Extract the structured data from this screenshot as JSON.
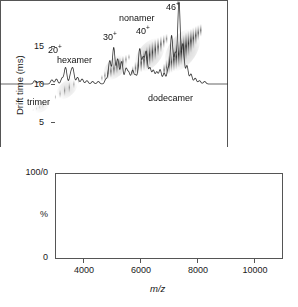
{
  "figure": {
    "panels": [
      {
        "id": "mobility",
        "role": "ion-mobility-2d-plot"
      },
      {
        "id": "spectrum",
        "role": "mass-spectrum"
      }
    ]
  },
  "top_panel": {
    "ylabel": "Drift time (ms)",
    "yticks": [
      "5",
      "10",
      "15"
    ]
  },
  "bottom_panel": {
    "ylabel": "%",
    "ytick_top": "100/0",
    "ytick_bottom": "0",
    "xlabel": "m/z",
    "xticks": [
      "4000",
      "6000",
      "8000",
      "10000"
    ]
  },
  "annotations": {
    "oligomers": [
      {
        "name": "trimer",
        "label": "trimer"
      },
      {
        "name": "hexamer",
        "label": "hexamer"
      },
      {
        "name": "nonamer",
        "label": "nonamer"
      },
      {
        "name": "dodecamer",
        "label": "dodecamer"
      }
    ],
    "charge_states": [
      {
        "name": "charge-20",
        "base": "20",
        "sup": "+"
      },
      {
        "name": "charge-30",
        "base": "30",
        "sup": "+"
      },
      {
        "name": "charge-40",
        "base": "40",
        "sup": "+"
      },
      {
        "name": "charge-46",
        "base": "46",
        "sup": "+"
      }
    ]
  },
  "colors": {
    "axis": "#555555",
    "text": "#111111",
    "trace": "#333333",
    "blob": "#808080"
  },
  "chart_data": [
    {
      "type": "scatter",
      "id": "ion-mobility-2d",
      "title": "",
      "xlabel": "m/z",
      "ylabel": "Drift time (ms)",
      "xlim": [
        3000,
        11000
      ],
      "ylim": [
        0,
        18.5
      ],
      "grid": false,
      "legend": "none",
      "yticks": [
        5,
        10,
        15
      ],
      "note": "Greyscale intensity map; each oligomer appears as a tilted elliptical cloud of vertically striated charge-state spots running diagonally from low m/z / low drift time to high m/z / high drift time.",
      "features": [
        {
          "label": "trimer",
          "oligomer_order": 3,
          "mz_center": 4450,
          "mz_span": [
            4150,
            4750
          ],
          "drift_center": 5.1,
          "drift_span": [
            4.6,
            5.6
          ],
          "intensity": 0.18,
          "label_pos": {
            "mz": 4900,
            "drift": 6.6
          }
        },
        {
          "label": "trimer-cluster-2",
          "oligomer_order": 3,
          "mz_center": 5350,
          "mz_span": [
            4950,
            5800
          ],
          "drift_center": 7.3,
          "drift_span": [
            6.2,
            8.5
          ],
          "intensity": 0.55,
          "label_pos": null
        },
        {
          "label": "hexamer",
          "oligomer_order": 6,
          "mz_center": 7050,
          "mz_span": [
            6550,
            7550
          ],
          "drift_center": 10.0,
          "drift_span": [
            8.6,
            11.6
          ],
          "intensity": 0.8,
          "label_pos": {
            "mz": 6500,
            "drift": 11.6
          }
        },
        {
          "label": "nonamer",
          "oligomer_order": 9,
          "mz_center": 8250,
          "mz_span": [
            7650,
            8900
          ],
          "drift_center": 11.6,
          "drift_span": [
            9.4,
            14.0
          ],
          "intensity": 0.9,
          "label_pos": {
            "mz": 8500,
            "drift": 16.3
          }
        },
        {
          "label": "dodecamer",
          "oligomer_order": 12,
          "mz_center": 9400,
          "mz_span": [
            8750,
            10100
          ],
          "drift_center": 12.2,
          "drift_span": [
            9.5,
            15.2
          ],
          "intensity": 1.0,
          "label_pos": {
            "mz": 9700,
            "drift": 8.7
          }
        }
      ]
    },
    {
      "type": "line",
      "id": "mass-spectrum",
      "title": "",
      "xlabel": "m/z",
      "ylabel": "%",
      "xlim": [
        3000,
        11000
      ],
      "ylim": [
        0,
        100
      ],
      "grid": false,
      "legend": "none",
      "xticks": [
        4000,
        6000,
        8000,
        10000
      ],
      "ytick_labels": {
        "top": "100/0",
        "bottom": "0"
      },
      "peaks": [
        {
          "mz": 4220,
          "intensity": 4
        },
        {
          "mz": 4380,
          "intensity": 3
        },
        {
          "mz": 4820,
          "intensity": 5
        },
        {
          "mz": 4980,
          "intensity": 6
        },
        {
          "mz": 5180,
          "intensity": 7
        },
        {
          "mz": 5300,
          "intensity": 20,
          "charge": 20,
          "label": "20+"
        },
        {
          "mz": 5480,
          "intensity": 11
        },
        {
          "mz": 5560,
          "intensity": 17
        },
        {
          "mz": 5720,
          "intensity": 8
        },
        {
          "mz": 5880,
          "intensity": 6
        },
        {
          "mz": 6050,
          "intensity": 4
        },
        {
          "mz": 6250,
          "intensity": 3
        },
        {
          "mz": 6450,
          "intensity": 3
        },
        {
          "mz": 6720,
          "intensity": 6
        },
        {
          "mz": 6850,
          "intensity": 28
        },
        {
          "mz": 6990,
          "intensity": 44,
          "charge": 30,
          "label": "30+"
        },
        {
          "mz": 7130,
          "intensity": 30
        },
        {
          "mz": 7270,
          "intensity": 27
        },
        {
          "mz": 7420,
          "intensity": 18
        },
        {
          "mz": 7520,
          "intensity": 13
        },
        {
          "mz": 7650,
          "intensity": 16
        },
        {
          "mz": 7760,
          "intensity": 10
        },
        {
          "mz": 7900,
          "intensity": 42
        },
        {
          "mz": 8020,
          "intensity": 30
        },
        {
          "mz": 8130,
          "intensity": 38,
          "charge": 40,
          "label": "40+"
        },
        {
          "mz": 8260,
          "intensity": 19
        },
        {
          "mz": 8380,
          "intensity": 16
        },
        {
          "mz": 8500,
          "intensity": 14
        },
        {
          "mz": 8620,
          "intensity": 17
        },
        {
          "mz": 8760,
          "intensity": 13
        },
        {
          "mz": 8900,
          "intensity": 18
        },
        {
          "mz": 9020,
          "intensity": 58
        },
        {
          "mz": 9150,
          "intensity": 36
        },
        {
          "mz": 9280,
          "intensity": 100,
          "charge": 46,
          "label": "46+"
        },
        {
          "mz": 9420,
          "intensity": 48
        },
        {
          "mz": 9560,
          "intensity": 22
        },
        {
          "mz": 9700,
          "intensity": 12
        },
        {
          "mz": 9850,
          "intensity": 7
        },
        {
          "mz": 10000,
          "intensity": 4
        },
        {
          "mz": 10180,
          "intensity": 3
        }
      ]
    }
  ]
}
